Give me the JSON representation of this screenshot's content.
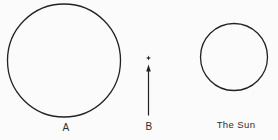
{
  "figure": {
    "labels": {
      "a": "A",
      "b": "B",
      "sun": "The Sun"
    }
  },
  "colors": {
    "background": "#fbfbfb",
    "line": "#222222",
    "text": "#2e2e2e"
  }
}
